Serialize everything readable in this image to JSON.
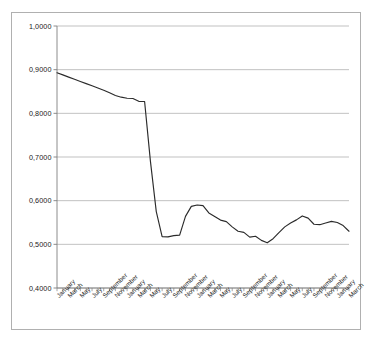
{
  "chart_title": "",
  "chart_data": {
    "type": "line",
    "title": "",
    "subtitle": "",
    "xlabel": "",
    "ylabel": "",
    "grid": true,
    "grid_axis": "y",
    "legend": false,
    "legend_position": "none",
    "decimal_separator": ",",
    "line_color": "#2b2b2b",
    "background_color": "#ffffff",
    "grid_color": "#a8a8a8",
    "axis_color": "#808080",
    "ylim": [
      0.4,
      1.0
    ],
    "ytick_values": [
      1.0,
      0.9,
      0.8,
      0.7,
      0.6,
      0.5,
      0.4
    ],
    "ytick_labels": [
      "1,0000",
      "0,9000",
      "0,8000",
      "0,7000",
      "0,6000",
      "0,5000",
      "0,4000"
    ],
    "xtick_labels": [
      "January",
      "March",
      "May",
      "July",
      "September",
      "November",
      "January",
      "March",
      "May",
      "July",
      "September",
      "November",
      "January",
      "March",
      "May",
      "July",
      "September",
      "November",
      "January",
      "March",
      "May",
      "July",
      "September",
      "November",
      "January",
      "March"
    ],
    "x": [
      "January",
      "February",
      "March",
      "April",
      "May",
      "June",
      "July",
      "August",
      "September",
      "October",
      "November",
      "December",
      "January",
      "February",
      "March",
      "April",
      "May",
      "June",
      "July",
      "August",
      "September",
      "October",
      "November",
      "December",
      "January",
      "February",
      "March",
      "April",
      "May",
      "June",
      "July",
      "August",
      "September",
      "October",
      "November",
      "December",
      "January",
      "February",
      "March",
      "April",
      "May",
      "June",
      "July",
      "August",
      "September",
      "October",
      "November",
      "December",
      "January",
      "February",
      "March"
    ],
    "series": [
      {
        "name": "Rate",
        "values": [
          0.893,
          0.888,
          0.883,
          0.878,
          0.873,
          0.868,
          0.863,
          0.858,
          0.853,
          0.847,
          0.841,
          0.837,
          0.8345,
          0.834,
          0.8275,
          0.827,
          0.69,
          0.575,
          0.5175,
          0.517,
          0.52,
          0.521,
          0.564,
          0.587,
          0.59,
          0.5885,
          0.572,
          0.564,
          0.5555,
          0.552,
          0.54,
          0.53,
          0.5275,
          0.5165,
          0.5185,
          0.509,
          0.5035,
          0.513,
          0.527,
          0.54,
          0.549,
          0.556,
          0.565,
          0.56,
          0.546,
          0.545,
          0.549,
          0.5525,
          0.55,
          0.543,
          0.53
        ]
      }
    ],
    "annotations": [
      {
        "text": "sharp drop",
        "from_index": 15,
        "to_index": 18,
        "from_value": 0.827,
        "to_value": 0.5175
      }
    ],
    "value_min": 0.472,
    "value_max": 0.893,
    "n_points": 51
  }
}
